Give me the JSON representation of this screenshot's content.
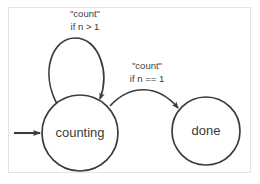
{
  "diagram": {
    "kind": "state-machine",
    "background_color": "#ffffff",
    "frame_color": "#e3e3e3",
    "stroke_color": "#3b3b3b",
    "text_color": "#3b3b3b",
    "states": [
      {
        "id": "counting",
        "label": "counting",
        "cx": 80,
        "cy": 133,
        "r": 38,
        "initial": true
      },
      {
        "id": "done",
        "label": "done",
        "cx": 206,
        "cy": 131,
        "r": 34,
        "initial": false
      }
    ],
    "transitions": [
      {
        "id": "self-loop",
        "from": "counting",
        "to": "counting",
        "event": "\"count\"",
        "guard": "if n > 1",
        "label_x": 85,
        "label_line1_y": 17,
        "label_line2_y": 30
      },
      {
        "id": "counting-to-done",
        "from": "counting",
        "to": "done",
        "event": "\"count\"",
        "guard": "if n == 1",
        "label_x": 147,
        "label_line1_y": 69,
        "label_line2_y": 82
      }
    ],
    "start_marker": {
      "label": "initial-state-arrow",
      "x1": 14,
      "x2": 40,
      "y": 133
    }
  }
}
